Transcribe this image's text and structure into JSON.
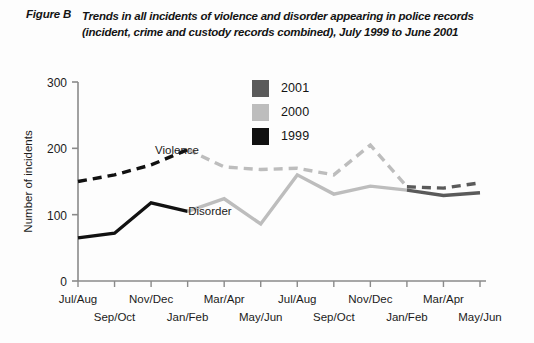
{
  "figure": {
    "label": "Figure B",
    "title_line1": "Trends in all incidents of violence and disorder appearing in police records",
    "title_line2": "(incident, crime and custody records combined), July 1999 to June 2001"
  },
  "legend": {
    "position": "inside-top-center",
    "items": [
      {
        "label": "2001",
        "color": "#5a5a5a"
      },
      {
        "label": "2000",
        "color": "#bdbdbd"
      },
      {
        "label": "1999",
        "color": "#111111"
      }
    ]
  },
  "annotations": [
    {
      "name": "violence-label",
      "text": "Violence"
    },
    {
      "name": "disorder-label",
      "text": "Disorder"
    }
  ],
  "chart_data": {
    "type": "line",
    "title": "Trends in all incidents of violence and disorder appearing in police records (incident, crime and custody records combined), July 1999 to June 2001",
    "xlabel": "",
    "ylabel": "Number of incidents",
    "ylim": [
      0,
      300
    ],
    "yticks": [
      0,
      100,
      200,
      300
    ],
    "grid": false,
    "legend_position": "inside-top-center",
    "categories": [
      "Jul/Aug",
      "Sep/Oct",
      "Nov/Dec",
      "Jan/Feb",
      "Mar/Apr",
      "May/Jun",
      "Jul/Aug",
      "Sep/Oct",
      "Nov/Dec",
      "Jan/Feb",
      "Mar/Apr",
      "May/Jun"
    ],
    "year_of_period": [
      "1999",
      "1999",
      "1999",
      "2000",
      "2000",
      "2000",
      "2000",
      "2000",
      "2000",
      "2001",
      "2001",
      "2001"
    ],
    "series": [
      {
        "name": "Violence",
        "style": "dashed",
        "values": [
          150,
          160,
          175,
          198,
          172,
          168,
          170,
          160,
          205,
          142,
          140,
          148
        ],
        "segments": [
          {
            "year": "1999",
            "color": "#111111",
            "from_index": 0,
            "to_index": 3
          },
          {
            "year": "2000",
            "color": "#bdbdbd",
            "from_index": 3,
            "to_index": 9
          },
          {
            "year": "2001",
            "color": "#5a5a5a",
            "from_index": 9,
            "to_index": 11
          }
        ]
      },
      {
        "name": "Disorder",
        "style": "solid",
        "values": [
          65,
          72,
          118,
          105,
          124,
          86,
          160,
          131,
          143,
          137,
          129,
          133
        ],
        "segments": [
          {
            "year": "1999",
            "color": "#111111",
            "from_index": 0,
            "to_index": 3
          },
          {
            "year": "2000",
            "color": "#bdbdbd",
            "from_index": 3,
            "to_index": 9
          },
          {
            "year": "2001",
            "color": "#5a5a5a",
            "from_index": 9,
            "to_index": 11
          }
        ]
      }
    ]
  }
}
